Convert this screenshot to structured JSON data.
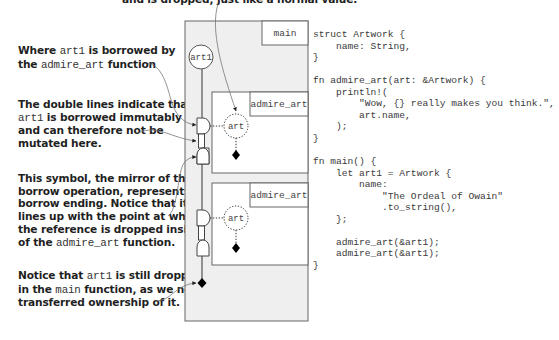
{
  "top_annotation": {
    "text": "and is dropped, just like a normal value."
  },
  "annotations": [
    {
      "id": "borrow-start",
      "lines": [
        [
          {
            "t": "Where "
          },
          {
            "t": "art1",
            "mono": true
          },
          {
            "t": " is borrowed by"
          }
        ],
        [
          {
            "t": "the "
          },
          {
            "t": "admire_art",
            "mono": true
          },
          {
            "t": " function"
          }
        ]
      ]
    },
    {
      "id": "immutable-borrow",
      "lines": [
        [
          {
            "t": "The double lines indicate that"
          }
        ],
        [
          {
            "t": "art1",
            "mono": true
          },
          {
            "t": " is borrowed immutably"
          }
        ],
        [
          {
            "t": "and can therefore not be"
          }
        ],
        [
          {
            "t": "mutated here."
          }
        ]
      ]
    },
    {
      "id": "borrow-end",
      "lines": [
        [
          {
            "t": "This symbol, the mirror of the"
          }
        ],
        [
          {
            "t": "borrow operation, represents the"
          }
        ],
        [
          {
            "t": "borrow ending. Notice that it"
          }
        ],
        [
          {
            "t": "lines up with the point at which"
          }
        ],
        [
          {
            "t": "the reference is dropped inside"
          }
        ],
        [
          {
            "t": "of the "
          },
          {
            "t": "admire_art",
            "mono": true
          },
          {
            "t": " function."
          }
        ]
      ]
    },
    {
      "id": "drop-in-main",
      "lines": [
        [
          {
            "t": "Notice that "
          },
          {
            "t": "art1",
            "mono": true
          },
          {
            "t": " is still dropped"
          }
        ],
        [
          {
            "t": "in the "
          },
          {
            "t": "main",
            "mono": true
          },
          {
            "t": " function, as we never"
          }
        ],
        [
          {
            "t": "transferred ownership of it."
          }
        ]
      ]
    }
  ],
  "diagram": {
    "main_label": "main",
    "owner_value": "art1",
    "calls": [
      {
        "label": "admire_art",
        "param": "art"
      },
      {
        "label": "admire_art",
        "param": "art"
      }
    ],
    "colors": {
      "outer_fill": "#efefef",
      "inner_fill": "#ffffff",
      "stroke": "#555555",
      "drop_marker": "#000000"
    }
  },
  "code": {
    "language": "rust",
    "lines": [
      "struct Artwork {",
      "    name: String,",
      "}",
      "",
      "fn admire_art(art: &Artwork) {",
      "    println!(",
      "        \"Wow, {} really makes you think.\",",
      "        art.name,",
      "    );",
      "}",
      "",
      "fn main() {",
      "    let art1 = Artwork {",
      "        name:",
      "            \"The Ordeal of Owain\"",
      "            .to_string(),",
      "    };",
      "",
      "    admire_art(&art1);",
      "    admire_art(&art1);",
      "}"
    ]
  }
}
